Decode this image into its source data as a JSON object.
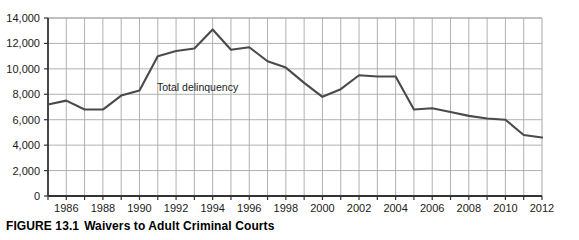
{
  "caption": {
    "label": "FIGURE 13.1",
    "title": "Waivers to Adult Criminal Courts"
  },
  "annotation": {
    "series_label": "Total delinquency"
  },
  "colors": {
    "line": "#4a4a4a",
    "grid": "#a8a8a8",
    "axis": "#333333",
    "text": "#1a1a1a"
  },
  "chart_data": {
    "type": "line",
    "title": "Waivers to Adult Criminal Courts",
    "xlabel": "",
    "ylabel": "",
    "ylim": [
      0,
      14000
    ],
    "xlim": [
      1985,
      2012
    ],
    "grid": true,
    "legend_position": "inline-annotation",
    "ytick_labels": [
      "14,000",
      "12,000",
      "10,000",
      "8,000",
      "6,000",
      "4,000",
      "2,000",
      "0"
    ],
    "ytick_values": [
      14000,
      12000,
      10000,
      8000,
      6000,
      4000,
      2000,
      0
    ],
    "xtick_labels": [
      "1986",
      "1988",
      "1990",
      "1992",
      "1994",
      "1996",
      "1998",
      "2000",
      "2002",
      "2004",
      "2006",
      "2008",
      "2010",
      "2012"
    ],
    "xtick_values": [
      1986,
      1988,
      1990,
      1992,
      1994,
      1996,
      1998,
      2000,
      2002,
      2004,
      2006,
      2008,
      2010,
      2012
    ],
    "x": [
      1985,
      1986,
      1987,
      1988,
      1989,
      1990,
      1991,
      1992,
      1993,
      1994,
      1995,
      1996,
      1997,
      1998,
      1999,
      2000,
      2001,
      2002,
      2003,
      2004,
      2005,
      2006,
      2007,
      2008,
      2009,
      2010,
      2011,
      2012
    ],
    "series": [
      {
        "name": "Total delinquency",
        "values": [
          7200,
          7500,
          6800,
          6800,
          7900,
          8300,
          11000,
          11400,
          11600,
          13100,
          11500,
          11700,
          10600,
          10100,
          8900,
          7800,
          8400,
          9500,
          9400,
          9400,
          6800,
          6900,
          6600,
          6300,
          6100,
          6000,
          4800,
          4600
        ]
      }
    ]
  }
}
